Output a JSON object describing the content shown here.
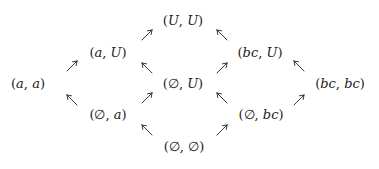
{
  "diagram": {
    "type": "lattice",
    "nodes": [
      {
        "id": "a_a",
        "open": "(",
        "first": "a",
        "sep": ", ",
        "second": "a",
        "close": ")",
        "x": 28,
        "y": 83
      },
      {
        "id": "a_U",
        "open": "(",
        "first": "a",
        "sep": ", ",
        "second": "U",
        "close": ")",
        "x": 108,
        "y": 52
      },
      {
        "id": "empty_a",
        "open": "(",
        "first": "∅",
        "sep": ", ",
        "second": "a",
        "close": ")",
        "x": 108,
        "y": 114
      },
      {
        "id": "U_U",
        "open": "(",
        "first": "U",
        "sep": ", ",
        "second": "U",
        "close": ")",
        "x": 183,
        "y": 20
      },
      {
        "id": "empty_U",
        "open": "(",
        "first": "∅",
        "sep": ", ",
        "second": "U",
        "close": ")",
        "x": 183,
        "y": 83
      },
      {
        "id": "empty_empty",
        "open": "(",
        "first": "∅",
        "sep": ", ",
        "second": "∅",
        "close": ")",
        "x": 184,
        "y": 146
      },
      {
        "id": "bc_U",
        "open": "(",
        "first": "bc",
        "sep": ", ",
        "second": "U",
        "close": ")",
        "x": 260,
        "y": 52
      },
      {
        "id": "empty_bc",
        "open": "(",
        "first": "∅",
        "sep": ", ",
        "second": "bc",
        "close": ")",
        "x": 261,
        "y": 114
      },
      {
        "id": "bc_bc",
        "open": "(",
        "first": "bc",
        "sep": ", ",
        "second": "bc",
        "close": ")",
        "x": 340,
        "y": 83
      }
    ],
    "arrows": [
      {
        "from": "a_a",
        "to": "a_U",
        "dir": "ne",
        "x": 72,
        "y": 66
      },
      {
        "from": "empty_a",
        "to": "a_a",
        "dir": "nw",
        "x": 72,
        "y": 100
      },
      {
        "from": "a_U",
        "to": "U_U",
        "dir": "ne",
        "x": 147,
        "y": 35
      },
      {
        "from": "empty_U",
        "to": "a_U",
        "dir": "nw",
        "x": 147,
        "y": 68
      },
      {
        "from": "empty_a",
        "to": "empty_U",
        "dir": "ne",
        "x": 147,
        "y": 98
      },
      {
        "from": "empty_empty",
        "to": "empty_a",
        "dir": "nw",
        "x": 147,
        "y": 130
      },
      {
        "from": "bc_U",
        "to": "U_U",
        "dir": "nw",
        "x": 222,
        "y": 35
      },
      {
        "from": "empty_U",
        "to": "bc_U",
        "dir": "ne",
        "x": 222,
        "y": 68
      },
      {
        "from": "empty_bc",
        "to": "empty_U",
        "dir": "nw",
        "x": 222,
        "y": 98
      },
      {
        "from": "empty_empty",
        "to": "empty_bc",
        "dir": "ne",
        "x": 222,
        "y": 130
      },
      {
        "from": "bc_bc",
        "to": "bc_U",
        "dir": "nw",
        "x": 299,
        "y": 66
      },
      {
        "from": "bc_bc",
        "to": "empty_bc",
        "dir": "ne",
        "x": 299,
        "y": 100
      }
    ]
  }
}
